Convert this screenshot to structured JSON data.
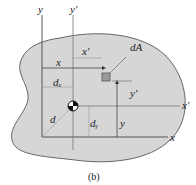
{
  "figure": {
    "caption": "(b)",
    "labels": {
      "y": "y",
      "y_prime": "y′",
      "x": "x",
      "x_prime": "x′",
      "x_prime_dist": "x′",
      "y_prime_dist": "y′",
      "x_dist": "x",
      "y_dist": "y",
      "dA": "dA",
      "d": "d",
      "dx": "dₓ",
      "dy": "dᵧ"
    },
    "colors": {
      "region_fill": "#d4d4d4",
      "axis_stroke": "#555555",
      "element_fill": "#9a9a9a"
    }
  }
}
